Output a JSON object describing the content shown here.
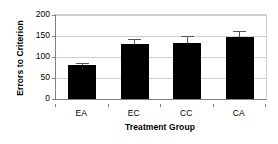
{
  "chart_data": {
    "type": "bar",
    "title": "",
    "subtitle": "",
    "xlabel": "Treatment Group",
    "ylabel": "Errors to Criterion",
    "categories": [
      "EA",
      "EC",
      "CC",
      "CA"
    ],
    "values": [
      80,
      131,
      134,
      147
    ],
    "errors": [
      6,
      13,
      16,
      14
    ],
    "error_type": "standard error bars",
    "ylim": [
      0,
      200
    ],
    "yticks": [
      0,
      50,
      100,
      150,
      200
    ],
    "ytick_labels": [
      "0",
      "50",
      "100",
      "150",
      "200"
    ],
    "grid": "horizontal",
    "legend": "none",
    "bar_color": "#000000",
    "errorbar_color": "#555555",
    "gridline_color": "#cfcfcf",
    "axis_color": "#808080",
    "background": "#ffffff",
    "series": [
      {
        "name": "Errors to Criterion",
        "values": [
          80,
          131,
          134,
          147
        ],
        "errors": [
          6,
          13,
          16,
          14
        ]
      }
    ],
    "points": [
      {
        "category": "EA",
        "value": 80,
        "error": 6
      },
      {
        "category": "EC",
        "value": 131,
        "error": 13
      },
      {
        "category": "CC",
        "value": 134,
        "error": 16
      },
      {
        "category": "CA",
        "value": 147,
        "error": 14
      }
    ]
  }
}
